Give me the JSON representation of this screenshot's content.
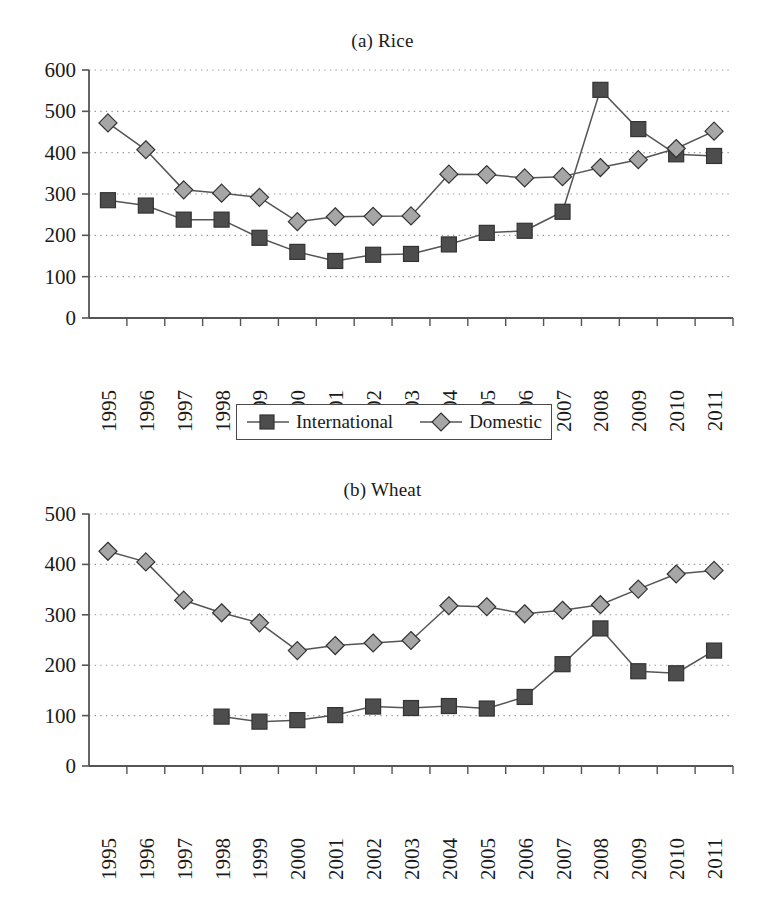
{
  "figure": {
    "series_colors": {
      "international": "#4d4d4d",
      "domestic": "#a6a6a6",
      "line": "#555555",
      "marker_edge": "#333333",
      "axis": "#555555",
      "grid": "#999999"
    }
  },
  "legend": {
    "entries": [
      {
        "label": "International",
        "marker": "square-marker",
        "color": "#4d4d4d"
      },
      {
        "label": "Domestic",
        "marker": "diamond-marker",
        "color": "#a6a6a6"
      }
    ]
  },
  "chart_data": [
    {
      "type": "line",
      "title": "(a) Rice",
      "xlabel": "",
      "ylabel": "",
      "ylim": [
        0,
        600
      ],
      "yticks": [
        0,
        100,
        200,
        300,
        400,
        500,
        600
      ],
      "grid": true,
      "legend_position": "bottom",
      "categories": [
        "1995",
        "1996",
        "1997",
        "1998",
        "1999",
        "2000",
        "2001",
        "2002",
        "2003",
        "2004",
        "2005",
        "2006",
        "2007",
        "2008",
        "2009",
        "2010",
        "2011"
      ],
      "series": [
        {
          "name": "International",
          "marker": "square-marker",
          "color": "#4d4d4d",
          "values": [
            285,
            272,
            238,
            238,
            194,
            160,
            138,
            153,
            155,
            178,
            206,
            211,
            257,
            552,
            457,
            396,
            392
          ]
        },
        {
          "name": "Domestic",
          "marker": "diamond-marker",
          "color": "#a6a6a6",
          "values": [
            472,
            407,
            310,
            302,
            292,
            233,
            245,
            246,
            247,
            348,
            347,
            339,
            342,
            364,
            383,
            410,
            452
          ]
        }
      ]
    },
    {
      "type": "line",
      "title": "(b) Wheat",
      "xlabel": "",
      "ylabel": "",
      "ylim": [
        0,
        500
      ],
      "yticks": [
        0,
        100,
        200,
        300,
        400,
        500
      ],
      "grid": true,
      "legend_position": "bottom",
      "categories": [
        "1995",
        "1996",
        "1997",
        "1998",
        "1999",
        "2000",
        "2001",
        "2002",
        "2003",
        "2004",
        "2005",
        "2006",
        "2007",
        "2008",
        "2009",
        "2010",
        "2011"
      ],
      "series": [
        {
          "name": "International",
          "marker": "square-marker",
          "color": "#4d4d4d",
          "values": [
            null,
            null,
            null,
            98,
            88,
            91,
            101,
            118,
            115,
            119,
            114,
            137,
            202,
            273,
            188,
            184,
            229
          ]
        },
        {
          "name": "Domestic",
          "marker": "diamond-marker",
          "color": "#a6a6a6",
          "values": [
            426,
            405,
            329,
            304,
            284,
            229,
            239,
            244,
            249,
            318,
            316,
            302,
            309,
            320,
            351,
            381,
            388
          ]
        }
      ]
    }
  ]
}
